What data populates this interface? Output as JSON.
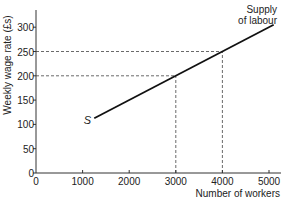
{
  "chart_data": {
    "type": "line",
    "title": "",
    "xlabel": "Number of workers",
    "ylabel": "Weekly wage rate (£s)",
    "xlim": [
      0,
      5200
    ],
    "ylim": [
      0,
      340
    ],
    "x_ticks": [
      0,
      1000,
      2000,
      3000,
      4000,
      5000
    ],
    "y_ticks": [
      0,
      50,
      100,
      150,
      200,
      250,
      300
    ],
    "grid": false,
    "legend": "none",
    "series": [
      {
        "name": "Supply of labour",
        "x": [
          1250,
          5100
        ],
        "y": [
          112.5,
          305
        ]
      }
    ],
    "annotations": [
      {
        "text": "S",
        "x": 1100,
        "y": 112,
        "style": "italic"
      },
      {
        "text": "Supply\nof labour",
        "x": 5100,
        "y": 320
      }
    ],
    "reference_lines": [
      {
        "type": "dashed",
        "from": [
          0,
          200
        ],
        "to": [
          3000,
          200
        ]
      },
      {
        "type": "dashed",
        "from": [
          3000,
          0
        ],
        "to": [
          3000,
          200
        ]
      },
      {
        "type": "dashed",
        "from": [
          0,
          250
        ],
        "to": [
          4000,
          250
        ]
      },
      {
        "type": "dashed",
        "from": [
          4000,
          0
        ],
        "to": [
          4000,
          250
        ]
      }
    ]
  },
  "labels": {
    "curve_start": "S",
    "curve_name_line1": "Supply",
    "curve_name_line2": "of labour",
    "xlabel": "Number of workers",
    "ylabel": "Weekly wage rate (£s)"
  }
}
